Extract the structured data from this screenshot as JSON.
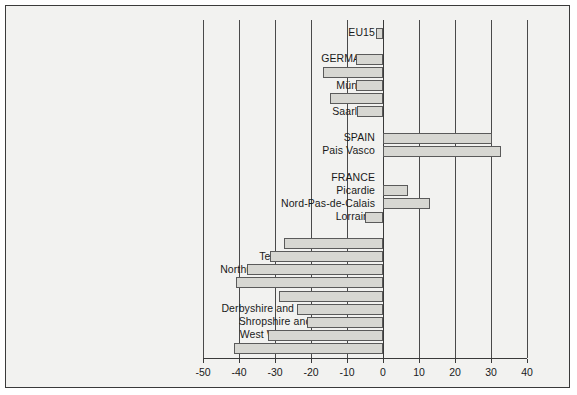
{
  "chart_data": {
    "type": "bar",
    "orientation": "horizontal",
    "title": "",
    "xlabel": "",
    "ylabel": "",
    "xlim": [
      -50,
      40
    ],
    "xticks": [
      -50,
      -40,
      -30,
      -20,
      -10,
      0,
      10,
      20,
      30,
      40
    ],
    "xticklabels": [
      "-50",
      "-40",
      "-30",
      "-20",
      "-10",
      "0",
      "10",
      "20",
      "30",
      "40"
    ],
    "grid": true,
    "legend": false,
    "bar_color": "#d7d7d2",
    "bar_edge_color": "#5a5a5a",
    "axis_color": "#3a3a3a",
    "background": "#f2f2f0",
    "categories": [
      "EU15",
      "",
      "GERMANY",
      "Düsseldorf",
      "Münster",
      "Arnsberg",
      "Saarland",
      "",
      "SPAIN",
      "Pais Vasco",
      "",
      "FRANCE",
      "Picardie",
      "Nord-Pas-de-Calais",
      "Lorraine",
      "",
      "UK",
      "Tees Valley and Durham",
      "Northumberland, Tyne and Wear",
      "Lancashire",
      "South Yorkshire",
      "Derbyshire and Nottinghamshire",
      "Shropshire and Staffordshire",
      "West Wales and The Valleys",
      "South-western Scotland"
    ],
    "values": [
      -2,
      null,
      -7.5,
      -16.7,
      -7.5,
      -14.7,
      -7.2,
      null,
      30.3,
      32.8,
      null,
      null,
      7,
      13,
      -5,
      null,
      -27.5,
      -31.4,
      -37.8,
      -40.8,
      -28.8,
      -23.8,
      -21.1,
      -32,
      -41.4
    ]
  }
}
